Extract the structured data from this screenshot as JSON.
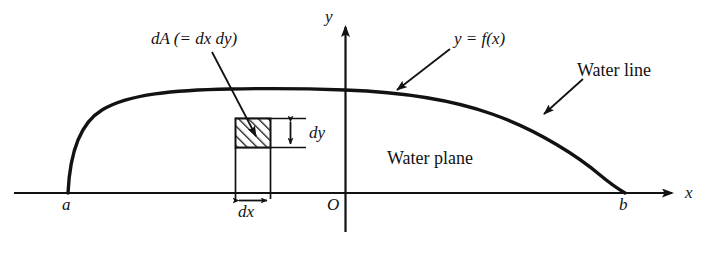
{
  "figure": {
    "title_present": false,
    "background_color": "#ffffff",
    "ink_color": "#121212",
    "axes": {
      "x_axis_label": "x",
      "y_axis_label": "y",
      "origin_label": "O",
      "x_axis_y_px": 193,
      "y_axis_x_px": 345,
      "x_axis_start_px": 14,
      "x_axis_end_px": 678,
      "y_axis_top_px": 20,
      "y_axis_bottom_px": 232
    },
    "points": {
      "left_intercept_label": "a",
      "right_intercept_label": "b",
      "left_intercept_x_px": 68,
      "right_intercept_x_px": 625
    },
    "curve": {
      "label": "y = f(x)",
      "description": "water line cross-section curve",
      "peak_y_px": 90,
      "stroke_width_px": 3.2
    },
    "annotations": [
      {
        "name": "dA-label",
        "text": "dA (= dx dy)",
        "style": "italic"
      },
      {
        "name": "curve-label",
        "text": "y = f(x)",
        "style": "italic"
      },
      {
        "name": "water-line-label",
        "text": "Water line",
        "style": "roman"
      },
      {
        "name": "water-plane-label",
        "text": "Water plane",
        "style": "roman"
      },
      {
        "name": "dy-label",
        "text": "dy",
        "style": "italic"
      },
      {
        "name": "dx-label",
        "text": "dx",
        "style": "italic"
      }
    ],
    "element": {
      "dx_label": "dy",
      "dy_label": "dx",
      "hatched_box": {
        "left_px": 235,
        "right_px": 270,
        "top_px": 118,
        "bottom_px": 148,
        "hatch_direction": "lower-left-to-upper-right"
      }
    }
  }
}
